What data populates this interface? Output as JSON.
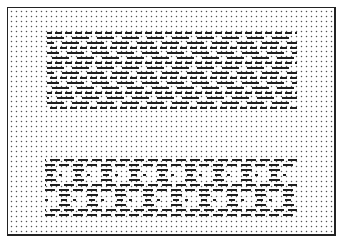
{
  "figure": {
    "type": "weave-dot-grid-pattern",
    "grid_spacing_px": 5,
    "ink_color": "#1e1e1e",
    "dot_color": "#555555",
    "border_color": "#222222"
  },
  "blocks": [
    {
      "name": "upper-block",
      "x_start": 47,
      "x_end": 297,
      "rows": [
        {
          "y": 33,
          "style": "short",
          "offset": 8
        },
        {
          "y": 38,
          "style": "long",
          "offset": 0
        },
        {
          "y": 43,
          "style": "long",
          "offset": 15
        },
        {
          "y": 48,
          "style": "short",
          "offset": 3
        },
        {
          "y": 53,
          "style": "long",
          "offset": 20
        },
        {
          "y": 58,
          "style": "long",
          "offset": 5
        },
        {
          "y": 63,
          "style": "short",
          "offset": 8
        },
        {
          "y": 68,
          "style": "long",
          "offset": 0
        },
        {
          "y": 73,
          "style": "long",
          "offset": 15
        },
        {
          "y": 78,
          "style": "short",
          "offset": 3
        },
        {
          "y": 83,
          "style": "long",
          "offset": 20
        },
        {
          "y": 88,
          "style": "long",
          "offset": 5
        },
        {
          "y": 93,
          "style": "short",
          "offset": 8
        },
        {
          "y": 98,
          "style": "long",
          "offset": 10
        },
        {
          "y": 103,
          "style": "long",
          "offset": 25
        },
        {
          "y": 108,
          "style": "short",
          "offset": 3
        }
      ]
    },
    {
      "name": "lower-block",
      "x_start": 45,
      "x_end": 297,
      "rows": [
        {
          "y": 160,
          "style": "medium",
          "offset": 5
        },
        {
          "y": 165,
          "style": "medium",
          "offset": 0
        },
        {
          "y": 170,
          "style": "bracket",
          "offset": 0
        },
        {
          "y": 175,
          "style": "bracket-inner",
          "offset": 0
        },
        {
          "y": 180,
          "style": "bracket",
          "offset": 0
        },
        {
          "y": 185,
          "style": "medium",
          "offset": 5
        },
        {
          "y": 190,
          "style": "medium",
          "offset": 0
        },
        {
          "y": 195,
          "style": "bracket",
          "offset": 14
        },
        {
          "y": 200,
          "style": "bracket-inner",
          "offset": 14
        },
        {
          "y": 205,
          "style": "bracket",
          "offset": 14
        },
        {
          "y": 210,
          "style": "medium",
          "offset": 5
        },
        {
          "y": 215,
          "style": "medium",
          "offset": 0
        }
      ]
    }
  ]
}
